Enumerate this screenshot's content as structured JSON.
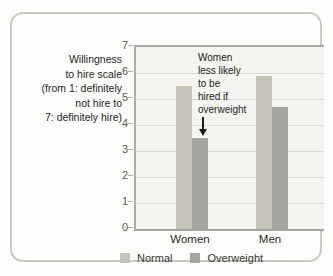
{
  "figure": {
    "kind": "textbook bar-graph panel"
  },
  "chart_data": {
    "type": "bar",
    "categories": [
      "Women",
      "Men"
    ],
    "series": [
      {
        "name": "Normal",
        "color": "#c6c4b9",
        "values": [
          5.5,
          5.9
        ]
      },
      {
        "name": "Overweight",
        "color": "#a4a4a0",
        "values": [
          3.5,
          4.7
        ]
      }
    ],
    "title": "",
    "xlabel": "",
    "ylabel": "Willingness to hire scale (from 1: definitely not hire to 7: definitely hire)",
    "ylabel_lines": [
      "Willingness",
      "to hire scale",
      "(from 1: definitely",
      "not hire to",
      "7: definitely hire)"
    ],
    "ylim": [
      0,
      7
    ],
    "y_ticks": [
      0,
      1,
      2,
      3,
      4,
      5,
      6,
      7
    ],
    "grid": "horizontal",
    "legend_position": "bottom",
    "annotation": {
      "text": "Women less likely to be hired if overweight",
      "lines": [
        "Women",
        "less likely",
        "to be",
        "hired if",
        "overweight"
      ],
      "arrow_points_to": "Women Overweight bar"
    },
    "colors": {
      "plot_background": "#f4f4f1",
      "gridline": "#d8d8d4",
      "axis_line": "#a6a6a2",
      "card_border": "#cbc9c4"
    }
  }
}
